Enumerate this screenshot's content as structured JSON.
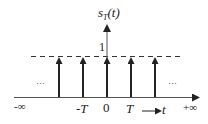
{
  "diagram": {
    "y_label": {
      "main": "s",
      "sub": "T",
      "rest": "(t)"
    },
    "amplitude_label": "1",
    "x_axis": {
      "left_end_label": "-∞",
      "right_end_label": "+∞",
      "tick_labels": [
        "-T",
        "0",
        "T"
      ],
      "variable_label": "t",
      "variable_arrow": "⟶"
    },
    "ellipsis_left": "···",
    "ellipsis_right": "···",
    "impulses": [
      {
        "position": "-2T",
        "height": 1
      },
      {
        "position": "-T",
        "height": 1
      },
      {
        "position": "0",
        "height": 1
      },
      {
        "position": "T",
        "height": 1
      },
      {
        "position": "2T",
        "height": 1
      }
    ],
    "colors": {
      "stroke": "#222222",
      "axis": "#555555",
      "background": "#ffffff"
    }
  }
}
